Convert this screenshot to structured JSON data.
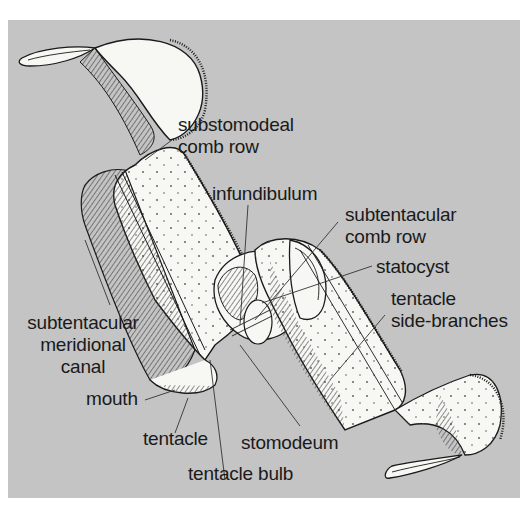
{
  "figure": {
    "background_color": "#c4c4c4",
    "body_fill": "#f7f7f4",
    "line_color": "#1a1a1a"
  },
  "labels": {
    "substomodeal_comb_row": {
      "line1": "substomodeal",
      "line2": "comb row"
    },
    "infundibulum": "infundibulum",
    "subtentacular_comb_row": {
      "line1": "subtentacular",
      "line2": "comb row"
    },
    "statocyst": "statocyst",
    "tentacle_side_branches": {
      "line1": "tentacle",
      "line2": "side-branches"
    },
    "subtentacular_meridional_canal": {
      "line1": "subtentacular",
      "line2": "meridional",
      "line3": "canal"
    },
    "mouth": "mouth",
    "tentacle": "tentacle",
    "stomodeum": "stomodeum",
    "tentacle_bulb": "tentacle bulb"
  }
}
